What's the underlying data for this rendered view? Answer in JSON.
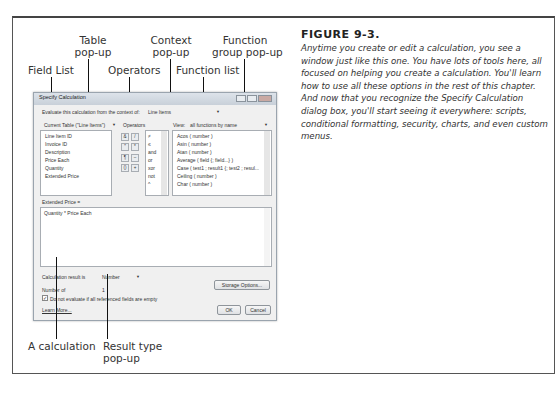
{
  "figure": {
    "label": "FIGURE 9-3.",
    "caption": "Anytime you create or edit a calculation, you see a window just like this one. You have lots of tools here, all focused on helping you create a calculation. You'll learn how to use all these options in the rest of this chapter. And now that you recognize the Specify Calculation dialog box, you'll start seeing it everywhere: scripts, conditional formatting, security, charts, and even custom menus."
  },
  "callouts": {
    "field_list": "Field List",
    "table_popup_1": "Table",
    "table_popup_2": "pop-up",
    "operators": "Operators",
    "context_popup_1": "Context",
    "context_popup_2": "pop-up",
    "function_list": "Function list",
    "function_group_1": "Function",
    "function_group_2": "group pop-up",
    "a_calculation": "A calculation",
    "result_type_1": "Result type",
    "result_type_2": "pop-up"
  },
  "dialog": {
    "title": "Specify Calculation",
    "context_label": "Evaluate this calculation from the context of:",
    "context_value": "Line Items",
    "table_value": "Current Table (\"Line Items\")",
    "operators_label": "Operators",
    "view_label": "View:",
    "view_value": "all functions by name",
    "fields": [
      "Line Item ID",
      "Invoice ID",
      "Description",
      "Price Each",
      "Quantity",
      "Extended Price"
    ],
    "operator_buttons": [
      [
        "&",
        "/"
      ],
      [
        "″",
        "*"
      ],
      [
        "¶",
        "–"
      ],
      [
        "()",
        "+"
      ]
    ],
    "comparison_ops": [
      "≠",
      "≤",
      "and",
      "or",
      "xor",
      "not",
      "^"
    ],
    "functions": [
      "Acos ( number )",
      "Asin ( number )",
      "Atan ( number )",
      "Average ( field {; field...} )",
      "Case ( test1 ; result1 {; test2 ; resul...",
      "Ceiling ( number )",
      "Char ( number )"
    ],
    "calc_field_label": "Extended Price =",
    "formula": "Quantity * Price Each",
    "result_label": "Calculation result is",
    "result_value": "Number",
    "repetitions_label": "Number of",
    "repetitions_value": "1",
    "storage_button": "Storage Options...",
    "dont_evaluate_label": "Do not evaluate if all referenced fields are empty",
    "dont_evaluate_checked": true,
    "learn_more": "Learn More...",
    "ok_button": "OK",
    "cancel_button": "Cancel"
  }
}
